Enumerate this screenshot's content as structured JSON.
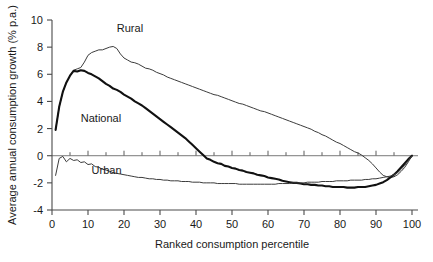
{
  "chart_data": {
    "type": "line",
    "title": "",
    "xlabel": "Ranked consumption percentile",
    "ylabel": "Average annual consumption growth (% p.a.)",
    "xlim": [
      0,
      100
    ],
    "ylim": [
      -4,
      10
    ],
    "xticks": [
      0,
      10,
      20,
      30,
      40,
      50,
      60,
      70,
      80,
      90,
      100
    ],
    "xtick_labels": [
      "0",
      "10",
      "20",
      "30",
      "40",
      "50",
      "60",
      "70",
      "80",
      "90",
      "100"
    ],
    "yticks": [
      -4,
      -2,
      0,
      2,
      4,
      6,
      8,
      10
    ],
    "ytick_labels": [
      "-4",
      "-2",
      "0",
      "2",
      "4",
      "6",
      "8",
      "10"
    ],
    "grid": false,
    "legend": "inline-annotations",
    "zero_line": true,
    "series": [
      {
        "name": "Rural",
        "style": "thin",
        "color": "#3c3c3c",
        "label_x": 18,
        "label_y": 9.1,
        "x": [
          1,
          2,
          3,
          4,
          5,
          6,
          7,
          8,
          9,
          10,
          11,
          12,
          13,
          14,
          15,
          16,
          17,
          18,
          19,
          20,
          21,
          22,
          23,
          24,
          25,
          26,
          27,
          28,
          29,
          30,
          31,
          32,
          33,
          34,
          35,
          36,
          37,
          38,
          39,
          40,
          41,
          42,
          43,
          44,
          45,
          46,
          47,
          48,
          49,
          50,
          51,
          52,
          53,
          54,
          55,
          56,
          57,
          58,
          59,
          60,
          61,
          62,
          63,
          64,
          65,
          66,
          67,
          68,
          69,
          70,
          71,
          72,
          73,
          74,
          75,
          76,
          77,
          78,
          79,
          80,
          81,
          82,
          83,
          84,
          85,
          86,
          87,
          88,
          89,
          90,
          91,
          92,
          93,
          94,
          95,
          96,
          97,
          98,
          99,
          100
        ],
        "y": [
          1.9,
          3.6,
          4.7,
          5.4,
          5.9,
          6.3,
          6.4,
          6.5,
          6.9,
          7.4,
          7.6,
          7.7,
          7.8,
          7.8,
          7.9,
          8.0,
          8.05,
          7.9,
          7.5,
          7.2,
          7.05,
          6.9,
          6.85,
          6.75,
          6.6,
          6.45,
          6.4,
          6.3,
          6.15,
          6.05,
          5.95,
          5.8,
          5.7,
          5.6,
          5.5,
          5.4,
          5.3,
          5.2,
          5.1,
          5.0,
          4.9,
          4.8,
          4.7,
          4.6,
          4.5,
          4.45,
          4.35,
          4.25,
          4.15,
          4.05,
          3.95,
          3.85,
          3.8,
          3.7,
          3.6,
          3.5,
          3.4,
          3.3,
          3.25,
          3.15,
          3.05,
          2.95,
          2.85,
          2.75,
          2.65,
          2.55,
          2.45,
          2.35,
          2.25,
          2.15,
          2.05,
          1.95,
          1.8,
          1.7,
          1.55,
          1.45,
          1.3,
          1.15,
          1.0,
          0.9,
          0.75,
          0.6,
          0.45,
          0.3,
          0.2,
          0.05,
          -0.15,
          -0.35,
          -0.6,
          -0.9,
          -1.2,
          -1.45,
          -1.55,
          -1.6,
          -1.55,
          -1.4,
          -1.15,
          -0.85,
          -0.45,
          0.0
        ]
      },
      {
        "name": "National",
        "style": "thick",
        "color": "#111111",
        "label_x": 8,
        "label_y": 2.5,
        "x": [
          1,
          2,
          3,
          4,
          5,
          6,
          7,
          8,
          9,
          10,
          11,
          12,
          13,
          14,
          15,
          16,
          17,
          18,
          19,
          20,
          21,
          22,
          23,
          24,
          25,
          26,
          27,
          28,
          29,
          30,
          31,
          32,
          33,
          34,
          35,
          36,
          37,
          38,
          39,
          40,
          41,
          42,
          43,
          44,
          45,
          46,
          47,
          48,
          49,
          50,
          51,
          52,
          53,
          54,
          55,
          56,
          57,
          58,
          59,
          60,
          61,
          62,
          63,
          64,
          65,
          66,
          67,
          68,
          69,
          70,
          71,
          72,
          73,
          74,
          75,
          76,
          77,
          78,
          79,
          80,
          81,
          82,
          83,
          84,
          85,
          86,
          87,
          88,
          89,
          90,
          91,
          92,
          93,
          94,
          95,
          96,
          97,
          98,
          99,
          100
        ],
        "y": [
          1.9,
          3.6,
          4.7,
          5.4,
          5.9,
          6.25,
          6.2,
          6.3,
          6.25,
          6.1,
          6.0,
          5.85,
          5.7,
          5.5,
          5.3,
          5.15,
          4.95,
          4.85,
          4.7,
          4.5,
          4.35,
          4.2,
          4.0,
          3.85,
          3.7,
          3.5,
          3.3,
          3.1,
          2.9,
          2.7,
          2.5,
          2.3,
          2.1,
          1.9,
          1.7,
          1.5,
          1.3,
          1.05,
          0.8,
          0.55,
          0.3,
          0.05,
          -0.2,
          -0.3,
          -0.45,
          -0.55,
          -0.6,
          -0.75,
          -0.8,
          -0.9,
          -0.95,
          -1.05,
          -1.1,
          -1.2,
          -1.25,
          -1.3,
          -1.4,
          -1.45,
          -1.5,
          -1.6,
          -1.65,
          -1.7,
          -1.75,
          -1.85,
          -1.9,
          -1.95,
          -2.0,
          -2.0,
          -2.05,
          -2.1,
          -2.1,
          -2.15,
          -2.15,
          -2.2,
          -2.2,
          -2.25,
          -2.25,
          -2.3,
          -2.3,
          -2.3,
          -2.3,
          -2.35,
          -2.35,
          -2.35,
          -2.3,
          -2.3,
          -2.3,
          -2.25,
          -2.2,
          -2.15,
          -2.05,
          -1.95,
          -1.8,
          -1.6,
          -1.4,
          -1.15,
          -0.85,
          -0.55,
          -0.25,
          0.0
        ]
      },
      {
        "name": "Urban",
        "style": "thin",
        "color": "#3c3c3c",
        "label_x": 11,
        "label_y": -1.35,
        "x": [
          1,
          2,
          3,
          4,
          5,
          6,
          7,
          8,
          9,
          10,
          11,
          12,
          13,
          14,
          15,
          16,
          17,
          18,
          19,
          20,
          21,
          22,
          23,
          24,
          25,
          26,
          27,
          28,
          29,
          30,
          31,
          32,
          33,
          34,
          35,
          36,
          37,
          38,
          39,
          40,
          41,
          42,
          43,
          44,
          45,
          46,
          47,
          48,
          49,
          50,
          51,
          52,
          53,
          54,
          55,
          56,
          57,
          58,
          59,
          60,
          61,
          62,
          63,
          64,
          65,
          66,
          67,
          68,
          69,
          70,
          71,
          72,
          73,
          74,
          75,
          76,
          77,
          78,
          79,
          80,
          81,
          82,
          83,
          84,
          85,
          86,
          87,
          88,
          89,
          90,
          91,
          92,
          93,
          94,
          95,
          96,
          97,
          98,
          99,
          100
        ],
        "y": [
          -1.45,
          -0.2,
          -0.05,
          -0.45,
          -0.2,
          -0.35,
          -0.3,
          -0.5,
          -0.45,
          -0.65,
          -0.6,
          -0.8,
          -0.85,
          -1.0,
          -1.05,
          -1.15,
          -1.25,
          -1.3,
          -1.35,
          -1.4,
          -1.45,
          -1.5,
          -1.55,
          -1.6,
          -1.6,
          -1.65,
          -1.7,
          -1.7,
          -1.75,
          -1.75,
          -1.8,
          -1.8,
          -1.85,
          -1.85,
          -1.85,
          -1.9,
          -1.9,
          -1.9,
          -1.95,
          -1.95,
          -1.95,
          -2.0,
          -2.0,
          -2.0,
          -2.0,
          -2.05,
          -2.05,
          -2.05,
          -2.05,
          -2.05,
          -2.05,
          -2.1,
          -2.1,
          -2.1,
          -2.1,
          -2.1,
          -2.1,
          -2.1,
          -2.1,
          -2.1,
          -2.1,
          -2.1,
          -2.05,
          -2.05,
          -2.05,
          -2.05,
          -2.0,
          -2.0,
          -2.0,
          -2.0,
          -1.95,
          -1.95,
          -1.95,
          -1.95,
          -1.9,
          -1.9,
          -1.9,
          -1.9,
          -1.85,
          -1.85,
          -1.85,
          -1.85,
          -1.8,
          -1.8,
          -1.8,
          -1.8,
          -1.75,
          -1.75,
          -1.7,
          -1.7,
          -1.65,
          -1.6,
          -1.55,
          -1.5,
          -1.4,
          -1.25,
          -1.0,
          -0.7,
          -0.35,
          0.0
        ]
      }
    ]
  }
}
